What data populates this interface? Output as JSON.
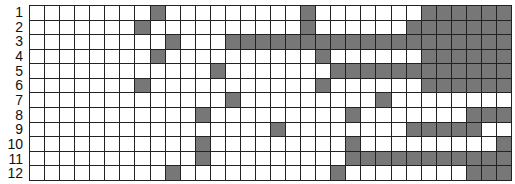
{
  "grid": {
    "columns": 32,
    "fill_color": "#777777",
    "empty_color": "#ffffff",
    "line_color": "#222222",
    "rows": [
      {
        "label": "1",
        "filled": [
          8,
          18,
          26,
          27,
          28,
          29,
          30,
          31
        ]
      },
      {
        "label": "2",
        "filled": [
          7,
          18,
          25,
          26,
          27,
          28,
          29,
          30,
          31
        ]
      },
      {
        "label": "3",
        "filled": [
          9,
          13,
          14,
          15,
          16,
          17,
          18,
          19,
          20,
          21,
          22,
          23,
          24,
          25,
          26,
          27,
          28,
          29,
          30,
          31
        ]
      },
      {
        "label": "4",
        "filled": [
          8,
          19,
          26,
          27,
          28,
          29,
          30,
          31
        ]
      },
      {
        "label": "5",
        "filled": [
          12,
          20,
          21,
          22,
          23,
          24,
          25,
          26,
          27,
          28,
          29,
          30,
          31
        ]
      },
      {
        "label": "6",
        "filled": [
          7,
          19,
          26,
          27,
          28,
          29,
          30,
          31
        ]
      },
      {
        "label": "7",
        "filled": [
          13,
          23
        ]
      },
      {
        "label": "8",
        "filled": [
          11,
          21,
          29,
          30,
          31
        ]
      },
      {
        "label": "9",
        "filled": [
          16,
          25,
          26,
          27,
          28,
          29
        ]
      },
      {
        "label": "10",
        "filled": [
          11,
          21,
          31
        ]
      },
      {
        "label": "11",
        "filled": [
          11,
          21,
          22,
          23,
          24,
          25,
          26,
          27,
          28,
          29,
          30,
          31
        ]
      },
      {
        "label": "12",
        "filled": [
          9,
          20,
          29,
          30,
          31
        ]
      }
    ]
  }
}
